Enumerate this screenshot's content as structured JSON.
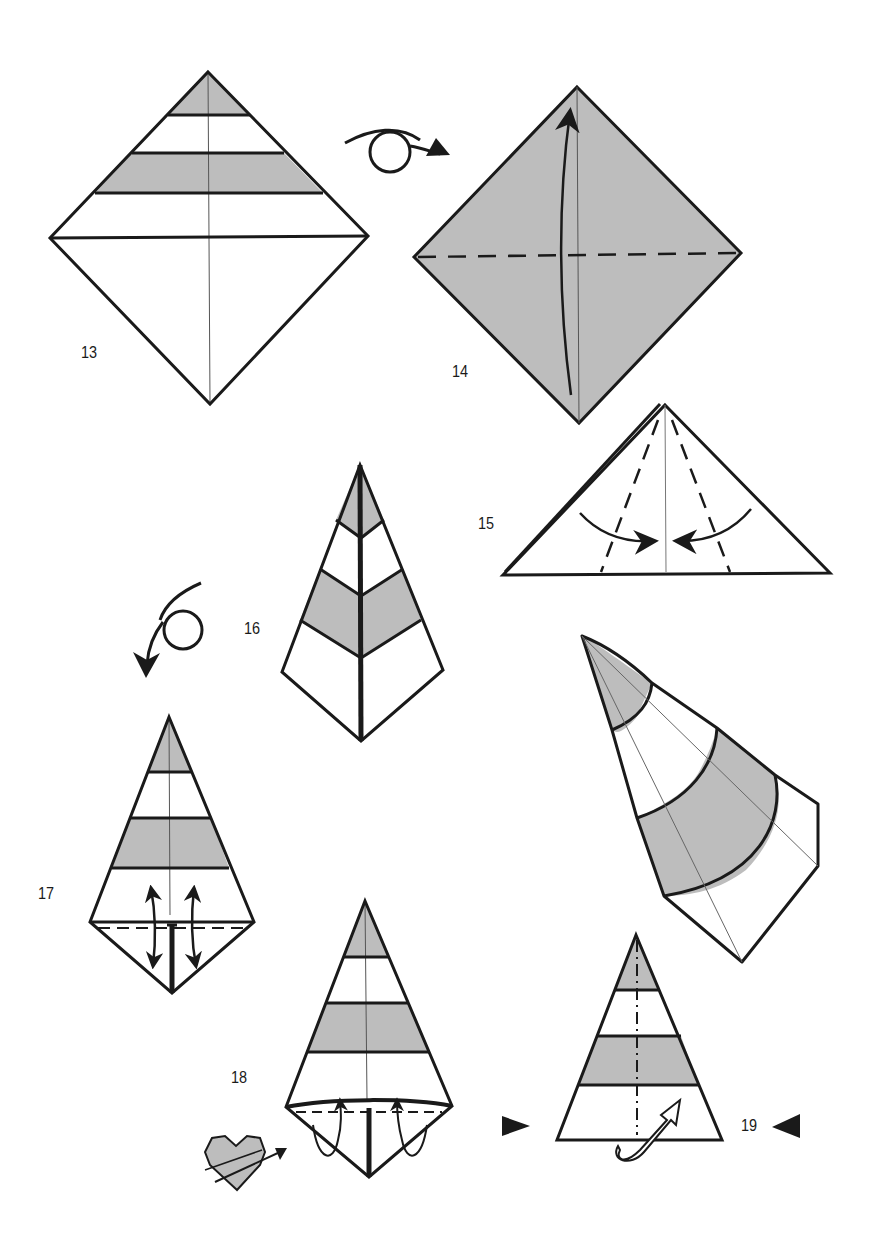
{
  "diagram": {
    "colors": {
      "paper_gray": "#bdbdbd",
      "line": "#1a1a1a",
      "background": "#ffffff"
    },
    "steps": [
      {
        "number": "13",
        "label": "13",
        "shape": "square-diamond-striped",
        "symbols": [
          "valley-crease-center"
        ]
      },
      {
        "number": "14",
        "label": "14",
        "shape": "gray-diamond",
        "symbols": [
          "turn-over-arrow",
          "valley-fold-dashed-horizontal",
          "fold-up-arrow"
        ]
      },
      {
        "number": "15",
        "label": "15",
        "shape": "triangle",
        "symbols": [
          "valley-fold-dashed-diagonals",
          "fold-in-arrows"
        ]
      },
      {
        "number": "16",
        "label": "16",
        "shape": "kite-chevron-stripes",
        "symbols": []
      },
      {
        "number": "17",
        "label": "17",
        "shape": "kite-striped",
        "symbols": [
          "turn-over-arrow",
          "fold-unfold-arrows",
          "valley-fold-dashed"
        ]
      },
      {
        "number": "18",
        "label": "18",
        "shape": "kite-striped",
        "symbols": [
          "tuck-in-arrows",
          "heart-symbol"
        ]
      },
      {
        "number": "19",
        "label": "19",
        "shape": "triangle-striped",
        "symbols": [
          "mountain-fold-dash-dot",
          "open-arrow",
          "view-arrows"
        ]
      },
      {
        "number": "",
        "label": "",
        "shape": "finished-cone",
        "symbols": []
      }
    ]
  }
}
